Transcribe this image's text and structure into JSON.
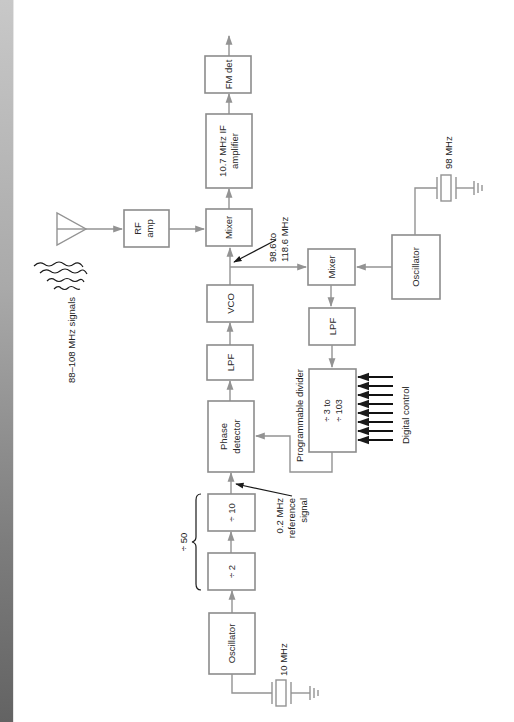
{
  "diagram": {
    "orientation": "rotated-90-ccw",
    "colors": {
      "wire": "#939393",
      "box_border": "#8c8c8c",
      "text": "#2a2a2a",
      "annotation_arrow": "#1a1a1a",
      "edge_strip_top": "#c8c8c8",
      "edge_strip_bottom": "#636363"
    },
    "blocks": {
      "fm_det": "FM det",
      "if_amp_line1": "10.7 MHz IF",
      "if_amp_line2": "amplifier",
      "mixer_top": "Mixer",
      "rf_amp_line1": "RF",
      "rf_amp_line2": "amp",
      "vco": "VCO",
      "lpf_main": "LPF",
      "phase_det_line1": "Phase",
      "phase_det_line2": "detector",
      "div10": "÷ 10",
      "div2": "÷ 2",
      "osc_ref": "Oscillator",
      "mixer_lower": "Mixer",
      "lpf_lower": "LPF",
      "prog_div_line1": "÷ 3 to",
      "prog_div_line2": "÷ 103",
      "osc_local": "Oscillator"
    },
    "labels": {
      "signals": "88–108 MHz signals",
      "vco_range_line1": "98.6 to",
      "vco_range_line2": "118.6 MHz",
      "crystal_local": "98 MHz",
      "crystal_ref": "10 MHz",
      "ref_line1": "0.2 MHz",
      "ref_line2": "reference",
      "ref_line3": "signal",
      "div50": "÷ 50",
      "prog_divider": "Programmable divider",
      "digital_control": "Digital control"
    },
    "digital_control_lines": 8
  }
}
